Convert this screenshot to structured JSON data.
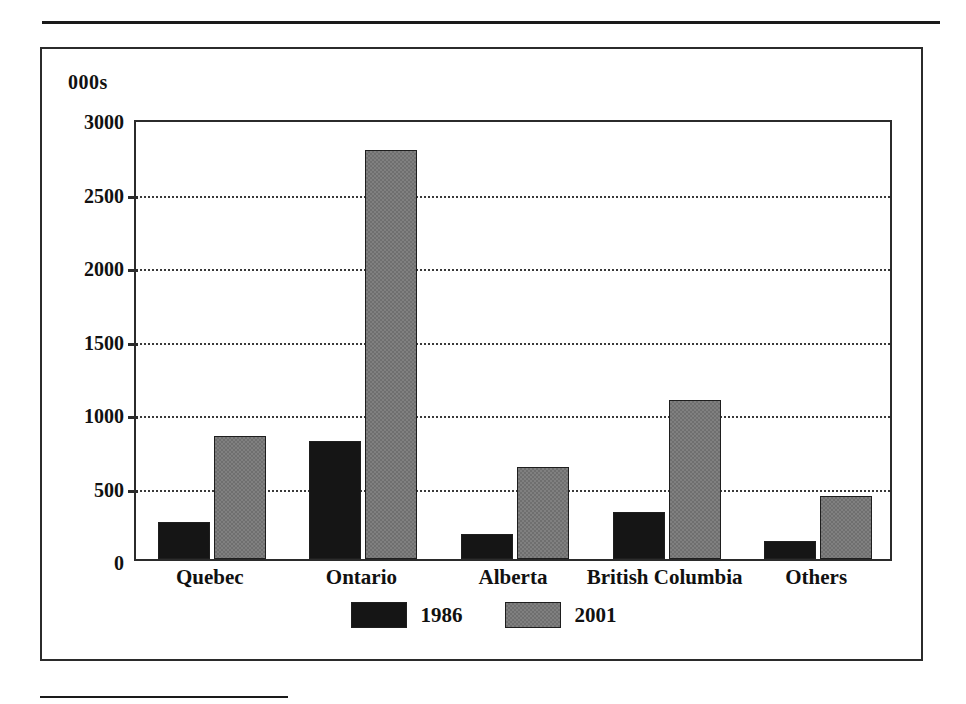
{
  "figure": {
    "axis_unit_caption": "000s"
  },
  "chart_data": {
    "type": "bar",
    "title": "",
    "subtitle": "",
    "xlabel": "",
    "ylabel": "000s",
    "categories": [
      "Quebec",
      "Ontario",
      "Alberta",
      "British Columbia",
      "Others"
    ],
    "series": [
      {
        "name": "1986",
        "color": "#151515",
        "values": [
          250,
          800,
          170,
          320,
          120
        ]
      },
      {
        "name": "2001",
        "color": "#808080",
        "values": [
          840,
          2780,
          625,
          1080,
          430
        ]
      }
    ],
    "ylim": [
      0,
      3000
    ],
    "ytick_values": [
      0,
      500,
      1000,
      1500,
      2000,
      2500,
      3000
    ],
    "ytick_labels": [
      "0",
      "500",
      "1000",
      "1500",
      "2000",
      "2500",
      "3000"
    ],
    "grid": true,
    "grid_style": "dotted-horizontal",
    "legend_position": "bottom-center",
    "legend_entries": [
      "1986",
      "2001"
    ],
    "annotations": []
  }
}
